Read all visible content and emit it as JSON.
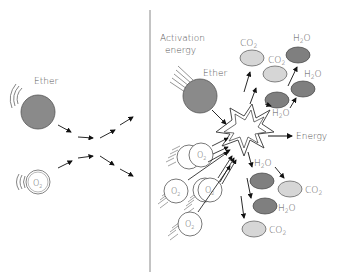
{
  "colors": {
    "ether": "#8a8a8a",
    "water": "#7f7f7f",
    "co2": "#d6d6d6",
    "stroke": "#444444",
    "divider": "#888888",
    "text": "#555555"
  },
  "left_panel": {
    "ether_label": "Ether",
    "o2_label": "O",
    "o2_sub": "2"
  },
  "right_panel": {
    "activation_label_line1": "Activation",
    "activation_label_line2": "energy",
    "ether_label": "Ether",
    "energy_label": "Energy",
    "o2_label": "O",
    "o2_sub": "2",
    "co2_label": "CO",
    "co2_sub": "2",
    "h2o_label_h": "H",
    "h2o_sub": "2",
    "h2o_label_o": "O"
  }
}
